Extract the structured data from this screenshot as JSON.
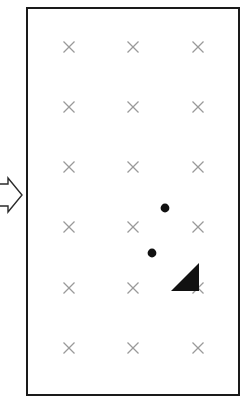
{
  "canvas": {
    "width": 245,
    "height": 418,
    "background_color": "#ffffff"
  },
  "colors": {
    "stroke": "#1a1a1a",
    "marker_gray": "#9a9a9a",
    "fill_black": "#111111",
    "arrow_outline": "#2b2b2b",
    "arrow_fill": "#ffffff"
  },
  "workspace_boundary": {
    "label": "workspace-boundary",
    "shape": "rectangle",
    "x": 26,
    "y": 7,
    "width": 214,
    "height": 389,
    "stroke_width": 2,
    "stroke_color": "#1a1a1a",
    "fill": "none"
  },
  "flow_arrow": {
    "label": "flow-arrow",
    "direction": "right",
    "points": "-12,184 8,184 8,178 22,195 8,212 8,206 -12,206",
    "stroke_color": "#2b2b2b",
    "fill_color": "#ffffff",
    "stroke_width": 1.4
  },
  "marker_grid": {
    "label": "x-marker-grid",
    "glyph": "x-mark",
    "rows": 6,
    "columns": 3,
    "column_x": [
      69,
      133,
      198
    ],
    "row_y": [
      47,
      107,
      167,
      227,
      288,
      348
    ],
    "marker_size": 11,
    "stroke_width": 1.3,
    "color": "#9a9a9a",
    "markers": [
      {
        "id": "r1c1",
        "x": 69,
        "y": 47
      },
      {
        "id": "r1c2",
        "x": 133,
        "y": 47
      },
      {
        "id": "r1c3",
        "x": 198,
        "y": 47
      },
      {
        "id": "r2c1",
        "x": 69,
        "y": 107
      },
      {
        "id": "r2c2",
        "x": 133,
        "y": 107
      },
      {
        "id": "r2c3",
        "x": 198,
        "y": 107
      },
      {
        "id": "r3c1",
        "x": 69,
        "y": 167
      },
      {
        "id": "r3c2",
        "x": 133,
        "y": 167
      },
      {
        "id": "r3c3",
        "x": 198,
        "y": 167
      },
      {
        "id": "r4c1",
        "x": 69,
        "y": 227
      },
      {
        "id": "r4c2",
        "x": 133,
        "y": 227
      },
      {
        "id": "r4c3",
        "x": 198,
        "y": 227
      },
      {
        "id": "r5c1",
        "x": 69,
        "y": 288
      },
      {
        "id": "r5c2",
        "x": 133,
        "y": 288
      },
      {
        "id": "r5c3",
        "x": 198,
        "y": 288
      },
      {
        "id": "r6c1",
        "x": 69,
        "y": 348
      },
      {
        "id": "r6c2",
        "x": 133,
        "y": 348
      },
      {
        "id": "r6c3",
        "x": 198,
        "y": 348
      }
    ]
  },
  "dots": {
    "label": "filled-dots",
    "color": "#111111",
    "items": [
      {
        "id": "dot-upper",
        "x": 165,
        "y": 208,
        "radius": 4.4
      },
      {
        "id": "dot-lower",
        "x": 152,
        "y": 253,
        "radius": 4.4
      }
    ]
  },
  "triangle": {
    "label": "filled-triangle",
    "points": "171,291 199,291 199,263",
    "color": "#111111",
    "orientation": "right-angle-bottom-right"
  }
}
